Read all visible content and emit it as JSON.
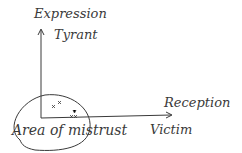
{
  "diagram": {
    "y_axis": {
      "label": "Expression",
      "top_label": "Tyrant"
    },
    "x_axis": {
      "label": "Reception",
      "right_label": "Victim"
    },
    "region": {
      "label": "Area of mistrust"
    },
    "marks": [
      {
        "x": 54,
        "y": 107,
        "glyph": "x"
      },
      {
        "x": 60,
        "y": 103,
        "glyph": "x"
      },
      {
        "x": 75,
        "y": 113,
        "glyph": "x"
      },
      {
        "x": 72,
        "y": 116,
        "glyph": "x"
      }
    ],
    "colors": {
      "ink": "#3a3a3a",
      "background": "#ffffff"
    }
  }
}
